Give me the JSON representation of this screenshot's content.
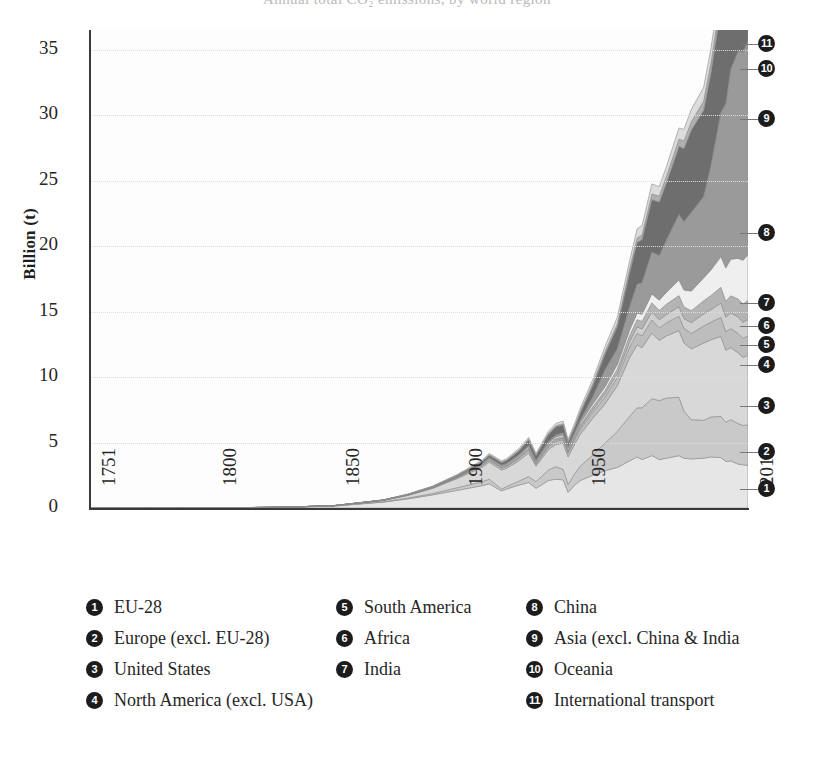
{
  "figure": {
    "clipped_title": "Annual total CO₂ emissions, by world region",
    "ylabel": "Billion (t)"
  },
  "chart_data": {
    "type": "area",
    "stacked": true,
    "title": "Annual total CO₂ emissions, by world region",
    "xlabel": "",
    "ylabel": "Billion (t)",
    "xlim": [
      1751,
      2018
    ],
    "ylim": [
      0,
      36.5
    ],
    "grid": "horizontal-dotted",
    "legend_position": "below",
    "ytick_labels": [
      "0",
      "5",
      "10",
      "15",
      "20",
      "25",
      "30",
      "35"
    ],
    "yticks": [
      0,
      5,
      10,
      15,
      20,
      25,
      30,
      35
    ],
    "xtick_labels": [
      "1751",
      "1800",
      "1850",
      "1900",
      "1950",
      "2018"
    ],
    "xticks": [
      1751,
      1800,
      1850,
      1900,
      1950,
      2018
    ],
    "x": [
      1751,
      1800,
      1830,
      1850,
      1870,
      1880,
      1890,
      1900,
      1910,
      1913,
      1918,
      1920,
      1925,
      1929,
      1932,
      1937,
      1940,
      1943,
      1945,
      1948,
      1950,
      1955,
      1960,
      1965,
      1970,
      1973,
      1975,
      1979,
      1982,
      1985,
      1990,
      1992,
      1995,
      2000,
      2003,
      2007,
      2009,
      2011,
      2014,
      2016,
      2018
    ],
    "series": [
      {
        "id": 1,
        "name": "EU-28",
        "values": [
          0.0,
          0.01,
          0.05,
          0.15,
          0.45,
          0.7,
          1.0,
          1.35,
          1.7,
          1.85,
          1.3,
          1.45,
          1.75,
          1.95,
          1.5,
          2.1,
          2.2,
          2.15,
          1.2,
          1.8,
          2.1,
          2.5,
          2.85,
          3.1,
          3.6,
          3.9,
          3.7,
          4.0,
          3.7,
          3.8,
          4.0,
          3.8,
          3.75,
          3.8,
          3.9,
          3.85,
          3.55,
          3.6,
          3.35,
          3.3,
          3.25
        ]
      },
      {
        "id": 2,
        "name": "Europe (excl. EU-28)",
        "values": [
          0.0,
          0.0,
          0.0,
          0.01,
          0.03,
          0.06,
          0.1,
          0.2,
          0.3,
          0.35,
          0.15,
          0.18,
          0.3,
          0.45,
          0.5,
          0.8,
          0.95,
          0.8,
          0.6,
          0.9,
          1.1,
          1.55,
          2.1,
          2.75,
          3.4,
          3.75,
          3.95,
          4.35,
          4.5,
          4.6,
          4.45,
          3.6,
          3.0,
          2.9,
          3.05,
          3.15,
          3.0,
          3.15,
          3.1,
          3.0,
          3.1
        ]
      },
      {
        "id": 3,
        "name": "United States",
        "values": [
          0.0,
          0.0,
          0.01,
          0.02,
          0.1,
          0.2,
          0.4,
          0.7,
          1.1,
          1.3,
          1.45,
          1.4,
          1.55,
          1.8,
          1.2,
          1.55,
          1.7,
          2.0,
          2.1,
          2.3,
          2.45,
          2.8,
          3.0,
          3.5,
          4.5,
          4.8,
          4.6,
          5.0,
          4.6,
          4.75,
          5.1,
          5.2,
          5.4,
          5.9,
          5.9,
          6.1,
          5.5,
          5.5,
          5.4,
          5.2,
          5.3
        ]
      },
      {
        "id": 4,
        "name": "North America (excl. USA)",
        "values": [
          0.0,
          0.0,
          0.0,
          0.0,
          0.01,
          0.02,
          0.04,
          0.07,
          0.12,
          0.15,
          0.16,
          0.15,
          0.18,
          0.22,
          0.15,
          0.2,
          0.24,
          0.28,
          0.3,
          0.34,
          0.38,
          0.45,
          0.52,
          0.62,
          0.8,
          0.88,
          0.9,
          1.0,
          0.95,
          1.0,
          1.1,
          1.12,
          1.18,
          1.3,
          1.35,
          1.45,
          1.4,
          1.45,
          1.48,
          1.45,
          1.5
        ]
      },
      {
        "id": 5,
        "name": "South America",
        "values": [
          0.0,
          0.0,
          0.0,
          0.0,
          0.0,
          0.01,
          0.01,
          0.02,
          0.04,
          0.05,
          0.04,
          0.05,
          0.06,
          0.08,
          0.06,
          0.09,
          0.1,
          0.09,
          0.09,
          0.12,
          0.14,
          0.18,
          0.24,
          0.3,
          0.4,
          0.5,
          0.52,
          0.62,
          0.62,
          0.64,
          0.72,
          0.75,
          0.82,
          0.92,
          0.95,
          1.1,
          1.12,
          1.2,
          1.25,
          1.22,
          1.25
        ]
      },
      {
        "id": 6,
        "name": "Africa",
        "values": [
          0.0,
          0.0,
          0.0,
          0.0,
          0.0,
          0.01,
          0.01,
          0.02,
          0.04,
          0.05,
          0.05,
          0.05,
          0.07,
          0.09,
          0.07,
          0.1,
          0.12,
          0.13,
          0.13,
          0.15,
          0.18,
          0.23,
          0.28,
          0.35,
          0.48,
          0.55,
          0.58,
          0.7,
          0.72,
          0.78,
          0.85,
          0.88,
          0.92,
          1.0,
          1.08,
          1.2,
          1.22,
          1.3,
          1.38,
          1.4,
          1.45
        ]
      },
      {
        "id": 7,
        "name": "India",
        "values": [
          0.0,
          0.0,
          0.0,
          0.0,
          0.01,
          0.01,
          0.02,
          0.03,
          0.05,
          0.06,
          0.07,
          0.07,
          0.08,
          0.1,
          0.09,
          0.11,
          0.12,
          0.14,
          0.14,
          0.15,
          0.17,
          0.22,
          0.27,
          0.35,
          0.42,
          0.5,
          0.55,
          0.68,
          0.78,
          0.92,
          1.2,
          1.3,
          1.5,
          1.75,
          1.95,
          2.35,
          2.55,
          2.8,
          3.1,
          3.35,
          3.5
        ]
      },
      {
        "id": 8,
        "name": "China",
        "values": [
          0.0,
          0.0,
          0.0,
          0.0,
          0.0,
          0.01,
          0.01,
          0.02,
          0.03,
          0.04,
          0.05,
          0.05,
          0.07,
          0.1,
          0.08,
          0.12,
          0.15,
          0.16,
          0.12,
          0.15,
          0.22,
          0.55,
          1.3,
          1.2,
          1.8,
          2.2,
          2.4,
          3.2,
          3.4,
          4.0,
          5.0,
          5.2,
          6.0,
          6.2,
          8.0,
          11.0,
          12.5,
          14.5,
          15.8,
          15.9,
          16.3
        ]
      },
      {
        "id": 9,
        "name": "Asia (excl. China & India",
        "values": [
          0.0,
          0.0,
          0.0,
          0.0,
          0.01,
          0.02,
          0.04,
          0.08,
          0.15,
          0.18,
          0.2,
          0.22,
          0.3,
          0.4,
          0.35,
          0.55,
          0.62,
          0.6,
          0.3,
          0.4,
          0.55,
          0.85,
          1.2,
          1.7,
          2.6,
          3.2,
          3.3,
          4.0,
          4.1,
          4.4,
          5.2,
          5.6,
          6.3,
          6.6,
          7.1,
          8.0,
          8.2,
          8.8,
          9.2,
          9.4,
          9.6
        ]
      },
      {
        "id": 10,
        "name": "Oceania",
        "values": [
          0.0,
          0.0,
          0.0,
          0.0,
          0.0,
          0.01,
          0.01,
          0.02,
          0.03,
          0.04,
          0.04,
          0.04,
          0.05,
          0.06,
          0.05,
          0.07,
          0.08,
          0.09,
          0.09,
          0.1,
          0.12,
          0.15,
          0.18,
          0.22,
          0.3,
          0.34,
          0.36,
          0.42,
          0.45,
          0.48,
          0.55,
          0.58,
          0.62,
          0.7,
          0.75,
          0.82,
          0.84,
          0.86,
          0.88,
          0.9,
          0.92
        ]
      },
      {
        "id": 11,
        "name": "International transport",
        "values": [
          0.0,
          0.0,
          0.0,
          0.0,
          0.01,
          0.02,
          0.03,
          0.05,
          0.08,
          0.1,
          0.09,
          0.1,
          0.12,
          0.15,
          0.12,
          0.16,
          0.18,
          0.2,
          0.18,
          0.22,
          0.25,
          0.32,
          0.4,
          0.5,
          0.62,
          0.7,
          0.7,
          0.78,
          0.72,
          0.75,
          0.85,
          0.88,
          0.95,
          1.05,
          1.1,
          1.25,
          1.25,
          1.3,
          1.35,
          1.4,
          1.45
        ]
      }
    ],
    "colors": [
      "#e6e6e6",
      "#c9c9c9",
      "#d8d8d8",
      "#bdbdbd",
      "#cfcfcf",
      "#b4b4b4",
      "#efefef",
      "#9a9a9a",
      "#6e6e6e",
      "#b0b0b0",
      "#dcdcdc"
    ],
    "badge_color": "#1c1c1c",
    "badge_text_color": "#ffffff"
  },
  "callouts": [
    {
      "id": "11",
      "label": "11",
      "y": 44
    },
    {
      "id": "10",
      "label": "10",
      "y": 69
    },
    {
      "id": "9",
      "label": "9",
      "y": 119
    },
    {
      "id": "8",
      "label": "8",
      "y": 233
    },
    {
      "id": "7",
      "label": "7",
      "y": 303
    },
    {
      "id": "6",
      "label": "6",
      "y": 326
    },
    {
      "id": "5",
      "label": "5",
      "y": 345
    },
    {
      "id": "4",
      "label": "4",
      "y": 365
    },
    {
      "id": "3",
      "label": "3",
      "y": 406
    },
    {
      "id": "2",
      "label": "2",
      "y": 452
    },
    {
      "id": "1",
      "label": "1",
      "y": 489
    }
  ],
  "legend": {
    "columns": [
      [
        {
          "num": "1",
          "label": "EU-28"
        },
        {
          "num": "2",
          "label": "Europe (excl. EU-28)"
        },
        {
          "num": "3",
          "label": "United States"
        },
        {
          "num": "4",
          "label": "North America (excl. USA)"
        }
      ],
      [
        {
          "num": "5",
          "label": "South America"
        },
        {
          "num": "6",
          "label": "Africa"
        },
        {
          "num": "7",
          "label": "India"
        }
      ],
      [
        {
          "num": "8",
          "label": "China"
        },
        {
          "num": "9",
          "label": "Asia (excl. China & India"
        },
        {
          "num": "10",
          "label": "Oceania"
        },
        {
          "num": "11",
          "label": "International transport"
        }
      ]
    ]
  }
}
